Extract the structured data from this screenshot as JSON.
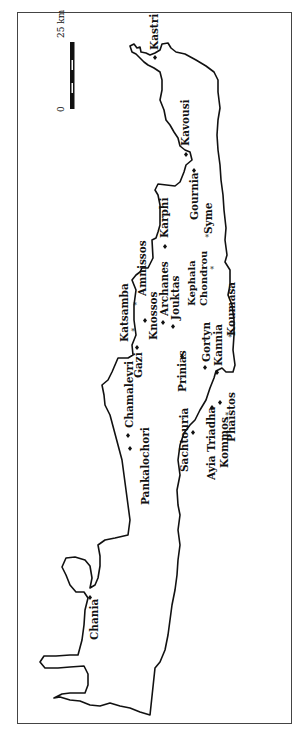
{
  "map": {
    "region": "Crete",
    "orientation": "rotated 90° counter-clockwise (north to the left)",
    "scale_bar": {
      "start_label": "0",
      "end_label": "25 km"
    },
    "sites": [
      {
        "name": "Kastri",
        "marker": "diamond"
      },
      {
        "name": "Kavousi",
        "marker": "diamond"
      },
      {
        "name": "Gournia",
        "marker": "diamond"
      },
      {
        "name": "Karphi",
        "marker": "diamond"
      },
      {
        "name": "Syme",
        "marker": "star"
      },
      {
        "name": "Kephala Chondrou",
        "marker": "star"
      },
      {
        "name": "Amnissos",
        "marker": "star"
      },
      {
        "name": "Katsamba",
        "marker": "star"
      },
      {
        "name": "Knossos",
        "marker": "diamond"
      },
      {
        "name": "Archanes",
        "marker": "diamond"
      },
      {
        "name": "Jouktas",
        "marker": "diamond"
      },
      {
        "name": "Gazi",
        "marker": "diamond"
      },
      {
        "name": "Koumasa",
        "marker": "star"
      },
      {
        "name": "Gortyn",
        "marker": "diamond"
      },
      {
        "name": "Kannia",
        "marker": "diamond"
      },
      {
        "name": "Prinias",
        "marker": "diamond"
      },
      {
        "name": "Phaistos",
        "marker": "diamond"
      },
      {
        "name": "Ayia Triadha",
        "marker": "diamond"
      },
      {
        "name": "Kommos",
        "marker": "star"
      },
      {
        "name": "Sachtouria",
        "marker": "diamond"
      },
      {
        "name": "Chamalevri",
        "marker": "diamond"
      },
      {
        "name": "Pankalochori",
        "marker": "diamond"
      },
      {
        "name": "Chania",
        "marker": "diamond"
      }
    ],
    "colors": {
      "ink": "#111111",
      "background": "#ffffff"
    }
  }
}
